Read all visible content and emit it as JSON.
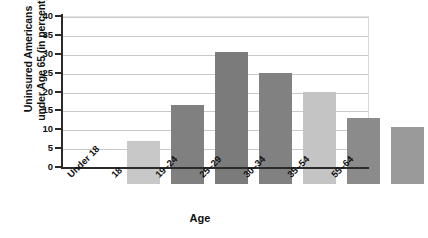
{
  "chart_data": {
    "type": "bar",
    "title": "",
    "xlabel": "Age",
    "ylabel": "Uninsured Americans\nunder Age 65 (in percent)",
    "categories": [
      "Under 18",
      "18",
      "19–24",
      "25–29",
      "30–34",
      "35–54",
      "55–64"
    ],
    "values": [
      11.5,
      21,
      35,
      29.5,
      24.5,
      17.5,
      15
    ],
    "ylim": [
      0,
      40
    ],
    "ytick_labels": [
      "0",
      "5",
      "10",
      "15",
      "20",
      "25",
      "30",
      "35",
      "40"
    ],
    "ytick_values": [
      0,
      5,
      10,
      15,
      20,
      25,
      30,
      35,
      40
    ],
    "grid": "horizontal",
    "legend": "none",
    "bar_colors": [
      "#c8c8c8",
      "#808080",
      "#7b7b7b",
      "#818181",
      "#c4c4c4",
      "#8b8b8b",
      "#9a9a9a"
    ],
    "series": [
      {
        "name": "Uninsured Americans under Age 65 (in percent)",
        "values": [
          11.5,
          21,
          35,
          29.5,
          24.5,
          17.5,
          15
        ]
      }
    ]
  },
  "colors": {
    "axis": "#2b2b2b",
    "gridline": "#c9c9c9",
    "text": "#111111",
    "background": "#ffffff"
  }
}
